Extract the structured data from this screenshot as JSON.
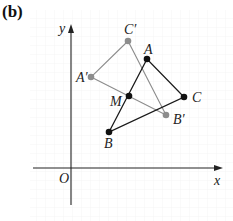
{
  "figure": {
    "panel_label": "(b)",
    "axes": {
      "x_label": "x",
      "y_label": "y",
      "origin_label": "O"
    },
    "colors": {
      "original": "#1a1a1a",
      "image": "#8c8c8c",
      "grid": "#eeeeee",
      "axis": "#222222"
    },
    "points": {
      "A": {
        "label": "A",
        "x": 147,
        "y": 59
      },
      "B": {
        "label": "B",
        "x": 109,
        "y": 132
      },
      "C": {
        "label": "C",
        "x": 184,
        "y": 97
      },
      "M": {
        "label": "M",
        "x": 129,
        "y": 96
      },
      "A_prime": {
        "label": "A′",
        "x": 91,
        "y": 77
      },
      "B_prime": {
        "label": "B′",
        "x": 166,
        "y": 115
      },
      "C_prime": {
        "label": "C′",
        "x": 128,
        "y": 41
      }
    },
    "triangles": [
      {
        "name": "ABC",
        "vertices": [
          "A",
          "B",
          "C"
        ],
        "style": "original"
      },
      {
        "name": "A′B′C′",
        "vertices": [
          "A′",
          "B′",
          "C′"
        ],
        "style": "image"
      }
    ],
    "center_of_rotation": "M"
  }
}
